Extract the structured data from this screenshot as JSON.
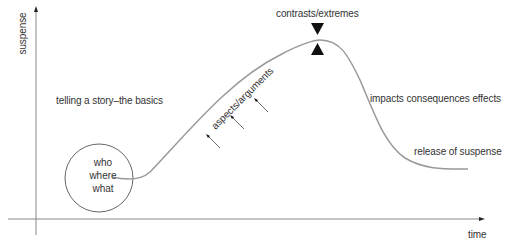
{
  "diagram": {
    "axes": {
      "y_label": "suspense",
      "x_label": "time"
    },
    "labels": {
      "intro": "telling a story–the basics",
      "climax": "contrasts/extremes",
      "rising": "aspects/arguments",
      "falling": "impacts consequences effects",
      "resolution": "release of suspense"
    },
    "circle": {
      "lines": [
        "who",
        "where",
        "what"
      ]
    },
    "colors": {
      "curve": "#999999",
      "axis": "#888888",
      "text": "#333333",
      "marker": "#111111"
    }
  }
}
